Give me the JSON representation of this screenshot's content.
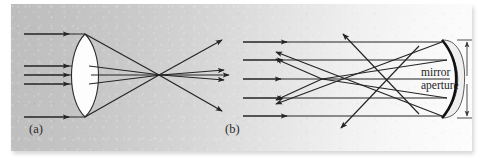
{
  "figure": {
    "kind": "optics-ray-diagram",
    "caption_labels": {
      "panel_a": "(a)",
      "panel_b": "(b)"
    },
    "annotations": {
      "mirror_aperture_line1": "mirror",
      "mirror_aperture_line2": "aperture"
    },
    "colors": {
      "ink": "#242424",
      "mirror_stroke": "#111111",
      "lens_fill": "#fdfdfd",
      "panel_light": "#fdfdfd",
      "panel_dark": "#bdbdbd",
      "page_background": "#ffffff"
    },
    "panels": [
      {
        "id": "a",
        "label": "(a)",
        "element": "biconvex-lens",
        "incoming_ray_count": 5,
        "incoming_ray_direction": "left-to-right",
        "behavior": "refraction-converging-with-spherical-aberration",
        "outgoing_ray_count": 5
      },
      {
        "id": "b",
        "label": "(b)",
        "element": "concave-spherical-mirror",
        "incoming_ray_count": 5,
        "incoming_ray_direction": "left-to-right",
        "behavior": "reflection-converging-with-spherical-aberration",
        "outgoing_ray_count": 5,
        "dimension_annotation": "mirror aperture"
      }
    ]
  }
}
